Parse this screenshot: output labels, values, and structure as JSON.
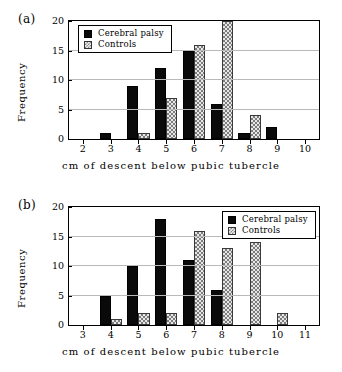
{
  "figure": {
    "panels": [
      {
        "panel_label": "(a)",
        "legend_position": "top-left"
      },
      {
        "panel_label": "(b)",
        "legend_position": "top-right"
      }
    ]
  },
  "chart_data": [
    {
      "type": "bar",
      "title": "(a)",
      "xlabel": "cm of descent below pubic tubercle",
      "ylabel": "Frequency",
      "categories": [
        "2",
        "3",
        "4",
        "5",
        "6",
        "7",
        "8",
        "9",
        "10"
      ],
      "xticks": [
        "2",
        "3",
        "4",
        "5",
        "6",
        "7",
        "8",
        "9",
        "10"
      ],
      "yticks": [
        "0",
        "5",
        "10",
        "15",
        "20"
      ],
      "xlim": [
        2,
        10
      ],
      "ylim": [
        0,
        20
      ],
      "grid": true,
      "legend": [
        "Cerebral palsy",
        "Controls"
      ],
      "legend_position": "top-left",
      "series": [
        {
          "name": "Cerebral palsy",
          "color": "#0a0a0a",
          "pattern": "solid",
          "values": [
            0,
            1,
            9,
            12,
            15,
            6,
            1,
            2,
            0
          ]
        },
        {
          "name": "Controls",
          "color": "#e7e7e7",
          "pattern": "checkered",
          "values": [
            0,
            0,
            1,
            7,
            16,
            20,
            4,
            0,
            0
          ],
          "clipped_bins": [
            "7"
          ]
        }
      ]
    },
    {
      "type": "bar",
      "title": "(b)",
      "xlabel": "cm of descent below pubic tubercle",
      "ylabel": "Frequency",
      "categories": [
        "3",
        "4",
        "5",
        "6",
        "7",
        "8",
        "9",
        "10",
        "11"
      ],
      "xticks": [
        "3",
        "4",
        "5",
        "6",
        "7",
        "8",
        "9",
        "10",
        "11"
      ],
      "yticks": [
        "0",
        "5",
        "10",
        "15",
        "20"
      ],
      "xlim": [
        3,
        11
      ],
      "ylim": [
        0,
        20
      ],
      "grid": true,
      "legend": [
        "Cerebral palsy",
        "Controls"
      ],
      "legend_position": "top-right",
      "series": [
        {
          "name": "Cerebral palsy",
          "color": "#0a0a0a",
          "pattern": "solid",
          "values": [
            0,
            5,
            10,
            18,
            11,
            6,
            0,
            0,
            0
          ]
        },
        {
          "name": "Controls",
          "color": "#e7e7e7",
          "pattern": "checkered",
          "values": [
            0,
            1,
            2,
            2,
            16,
            13,
            14,
            2,
            0
          ]
        }
      ]
    }
  ]
}
